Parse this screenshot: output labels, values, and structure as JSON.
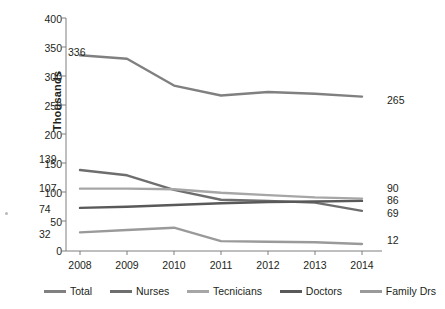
{
  "chart_data": {
    "type": "line",
    "title": "",
    "xlabel": "",
    "ylabel": "Thousands",
    "categories": [
      "2008",
      "2009",
      "2010",
      "2011",
      "2012",
      "2013",
      "2014"
    ],
    "ylim": [
      0,
      400
    ],
    "yticks": [
      0,
      50,
      100,
      150,
      200,
      250,
      300,
      350,
      400
    ],
    "grid": false,
    "legend_position": "bottom",
    "series": [
      {
        "name": "Total",
        "color": "#808080",
        "values": [
          336,
          330,
          284,
          267,
          273,
          270,
          265
        ],
        "start_label": "336",
        "end_label": "265"
      },
      {
        "name": "Nurses",
        "color": "#6e6e6e",
        "values": [
          139,
          130,
          105,
          88,
          86,
          83,
          69
        ],
        "start_label": "139",
        "end_label": "69"
      },
      {
        "name": "Tecnicians",
        "color": "#a6a6a6",
        "values": [
          107,
          107,
          106,
          100,
          96,
          92,
          90
        ],
        "start_label": "107",
        "end_label": "90"
      },
      {
        "name": "Doctors",
        "color": "#595959",
        "values": [
          74,
          76,
          79,
          82,
          84,
          85,
          86
        ],
        "start_label": "74",
        "end_label": "86"
      },
      {
        "name": "Family Drs",
        "color": "#9a9a9a",
        "values": [
          32,
          36,
          40,
          17,
          16,
          15,
          12
        ],
        "start_label": "32",
        "end_label": "12"
      }
    ]
  },
  "axis": {
    "y_title": "Thousands",
    "y_ticks": [
      "400",
      "350",
      "300",
      "250",
      "200",
      "150",
      "100",
      "50",
      "0"
    ],
    "x_ticks": [
      "2008",
      "2009",
      "2010",
      "2011",
      "2012",
      "2013",
      "2014"
    ]
  },
  "annotations": {
    "total_start": "336",
    "total_end": "265",
    "nurses_start": "139",
    "nurses_end": "69",
    "technicians_start": "107",
    "technicians_end": "90",
    "doctors_start": "74",
    "doctors_end": "86",
    "familydrs_start": "32",
    "familydrs_end": "12"
  },
  "legend": {
    "items": [
      {
        "label": "Total",
        "color": "#808080"
      },
      {
        "label": "Nurses",
        "color": "#6e6e6e"
      },
      {
        "label": "Tecnicians",
        "color": "#a6a6a6"
      },
      {
        "label": "Doctors",
        "color": "#595959"
      },
      {
        "label": "Family Drs",
        "color": "#9a9a9a"
      }
    ]
  }
}
